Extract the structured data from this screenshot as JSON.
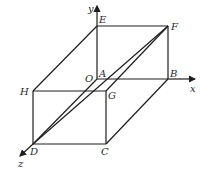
{
  "diagram": {
    "type": "rectangular-box-3d-coordinate-system",
    "stroke_color": "#1e1e1e",
    "axes": {
      "x": {
        "label": "x"
      },
      "y": {
        "label": "y"
      },
      "z": {
        "label": "z"
      },
      "origin": {
        "label": "O"
      }
    },
    "vertices": {
      "A": {
        "label": "A"
      },
      "B": {
        "label": "B"
      },
      "C": {
        "label": "C"
      },
      "D": {
        "label": "D"
      },
      "E": {
        "label": "E"
      },
      "F": {
        "label": "F"
      },
      "G": {
        "label": "G"
      },
      "H": {
        "label": "H"
      }
    },
    "edges": [
      "EF",
      "FB",
      "AB",
      "EA",
      "HG",
      "GC",
      "DC",
      "HD",
      "EH",
      "FG",
      "BC",
      "AD"
    ],
    "diagonals": [
      "FD"
    ]
  }
}
